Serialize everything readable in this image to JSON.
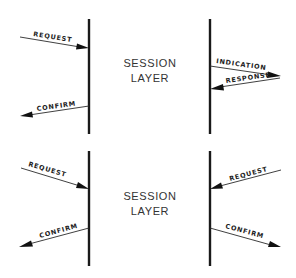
{
  "diagram": {
    "sections": [
      {
        "name": "top-confirmed-service",
        "layer_label": [
          "SESSION",
          "LAYER"
        ],
        "left_arrows": [
          {
            "label": "REQUEST",
            "direction": "in"
          },
          {
            "label": "CONFIRM",
            "direction": "out"
          }
        ],
        "right_arrows": [
          {
            "label": "INDICATION",
            "direction": "out"
          },
          {
            "label": "RESPONSE",
            "direction": "in"
          }
        ]
      },
      {
        "name": "bottom-collision",
        "layer_label": [
          "SESSION",
          "LAYER"
        ],
        "left_arrows": [
          {
            "label": "REQUEST",
            "direction": "in"
          },
          {
            "label": "CONFIRM",
            "direction": "out"
          }
        ],
        "right_arrows": [
          {
            "label": "REQUEST",
            "direction": "in"
          },
          {
            "label": "CONFIRM",
            "direction": "out"
          }
        ]
      }
    ]
  }
}
